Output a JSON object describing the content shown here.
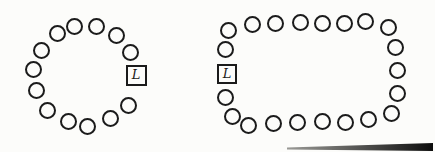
{
  "figure": {
    "background_color": "#fcfcfa",
    "stroke_color": "#1b1b1b",
    "leader_label": "L",
    "diagrams": [
      {
        "id": "circular-ring-network",
        "shape": "circle",
        "total_nodes": 14,
        "node_diameter": 17,
        "leader": {
          "x": 136,
          "y": 75,
          "size": 21,
          "label": "L"
        },
        "circles": [
          {
            "x": 74,
            "y": 26
          },
          {
            "x": 96,
            "y": 26
          },
          {
            "x": 116,
            "y": 35
          },
          {
            "x": 130,
            "y": 52
          },
          {
            "x": 128,
            "y": 105
          },
          {
            "x": 110,
            "y": 118
          },
          {
            "x": 87,
            "y": 126
          },
          {
            "x": 68,
            "y": 121
          },
          {
            "x": 47,
            "y": 110
          },
          {
            "x": 36,
            "y": 90
          },
          {
            "x": 33,
            "y": 69
          },
          {
            "x": 41,
            "y": 50
          },
          {
            "x": 57,
            "y": 33
          }
        ]
      },
      {
        "id": "rounded-rectangle-ring-network",
        "shape": "rounded-rectangle",
        "total_nodes": 22,
        "node_diameter": 17,
        "leader": {
          "x": 227,
          "y": 74,
          "size": 20,
          "label": "L"
        },
        "circles": [
          {
            "x": 228,
            "y": 30
          },
          {
            "x": 252,
            "y": 24
          },
          {
            "x": 275,
            "y": 23
          },
          {
            "x": 300,
            "y": 22
          },
          {
            "x": 322,
            "y": 23
          },
          {
            "x": 344,
            "y": 23
          },
          {
            "x": 365,
            "y": 21
          },
          {
            "x": 388,
            "y": 27
          },
          {
            "x": 395,
            "y": 47
          },
          {
            "x": 397,
            "y": 70
          },
          {
            "x": 397,
            "y": 93
          },
          {
            "x": 391,
            "y": 113
          },
          {
            "x": 368,
            "y": 119
          },
          {
            "x": 345,
            "y": 122
          },
          {
            "x": 322,
            "y": 121
          },
          {
            "x": 297,
            "y": 122
          },
          {
            "x": 273,
            "y": 123
          },
          {
            "x": 248,
            "y": 125
          },
          {
            "x": 232,
            "y": 116
          },
          {
            "x": 225,
            "y": 97
          },
          {
            "x": 225,
            "y": 49
          }
        ]
      }
    ],
    "scan_artifact": {
      "x": 287,
      "y": 143,
      "width": 146,
      "height": 8,
      "color_start": "#9a9a96",
      "color_end": "#0c0c0c"
    }
  }
}
